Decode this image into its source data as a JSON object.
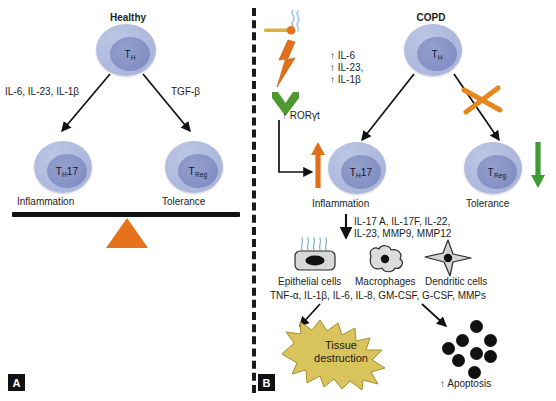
{
  "figure": {
    "panel_a": {
      "tag": "A",
      "title": "Healthy",
      "th_cell": {
        "label": "T",
        "sub": "H"
      },
      "left_cytokines": "IL-6, IL-23, IL-1β",
      "right_cytokines": "TGF-β",
      "th17_cell": {
        "label": "T",
        "sub": "H",
        "suffix": "17"
      },
      "treg_cell": {
        "label": "T",
        "sub": "Reg"
      },
      "left_outcome": "Inflammation",
      "right_outcome": "Tolerance",
      "fulcrum_color": "#e8721c",
      "beam_color": "#111111"
    },
    "panel_b": {
      "tag": "B",
      "title": "COPD",
      "stimulus": {
        "cigarette_icon": "cigarette-icon",
        "smoke_icon": "smoke-icon",
        "lightning_icon": "lightning-bolt-icon",
        "chevron_icon": "green-chevron-icon",
        "rorgt_label": "↑ RORγt"
      },
      "th_cell": {
        "label": "T",
        "sub": "H"
      },
      "left_cytokines": [
        "↑ IL-6",
        "↑ IL-23,",
        "↑ IL-1β"
      ],
      "blocked_icon": "orange-x-block-icon",
      "th17_cell": {
        "label": "T",
        "sub": "H",
        "suffix": "17"
      },
      "treg_cell": {
        "label": "T",
        "sub": "Reg"
      },
      "left_outcome": "Inflammation",
      "right_outcome": "Tolerance",
      "up_arrow_color": "#e8721c",
      "down_arrow_color": "#3f9b35",
      "effector_cytokines": [
        "IL-17 A, IL-17F, IL-22,",
        "IL-23, MMP9, MMP12"
      ],
      "cells": [
        {
          "name": "Epithelial cells",
          "icon": "epithelial-cell-icon"
        },
        {
          "name": "Macrophages",
          "icon": "macrophage-icon"
        },
        {
          "name": "Dendritic cells",
          "icon": "dendritic-cell-icon"
        }
      ],
      "secreted_mediators": "TNF-α, IL-1β, IL-6, IL-8, GM-CSF, G-CSF, MMPs",
      "tissue_destruction": {
        "line1": "Tissue",
        "line2": "destruction",
        "color": "#d9c35c"
      },
      "apoptosis_label": "↑ Apoptosis",
      "apoptosis_dot_count": 8
    }
  }
}
